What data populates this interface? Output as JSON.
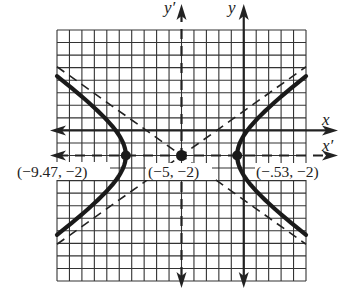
{
  "chart_data": {
    "type": "line",
    "title": "",
    "grid": true,
    "grid_cells": {
      "columns": 20,
      "rows": 20
    },
    "xlim": [
      -15,
      5
    ],
    "ylim": [
      -12,
      8
    ],
    "axes": {
      "x": {
        "label": "x",
        "position_y": 0,
        "style": "solid"
      },
      "y": {
        "label": "y",
        "position_x": 0,
        "style": "solid"
      },
      "x_prime": {
        "label": "x′",
        "position_y": -2,
        "style": "dashed"
      },
      "y_prime": {
        "label": "y′",
        "position_x": -5,
        "style": "dashed"
      }
    },
    "hyperbola": {
      "center": [
        -5,
        -2
      ],
      "a_squared": 20,
      "b_squared": 10,
      "orientation": "horizontal"
    },
    "asymptotes": [
      {
        "slope": 0.707,
        "through": [
          -5,
          -2
        ],
        "style": "dashed"
      },
      {
        "slope": -0.707,
        "through": [
          -5,
          -2
        ],
        "style": "dashed"
      }
    ],
    "points": [
      {
        "x": -9.47,
        "y": -2,
        "label": "(−9.47, −2)"
      },
      {
        "x": -5,
        "y": -2,
        "label": "(−5, −2)"
      },
      {
        "x": -0.53,
        "y": -2,
        "label": "(−.53, −2)"
      }
    ]
  },
  "labels": {
    "x": "x",
    "x_prime": "x′",
    "y": "y",
    "y_prime": "y′",
    "left_vertex": "(−9.47, −2)",
    "center": "(−5, −2)",
    "right_vertex": "(−.53, −2)"
  }
}
